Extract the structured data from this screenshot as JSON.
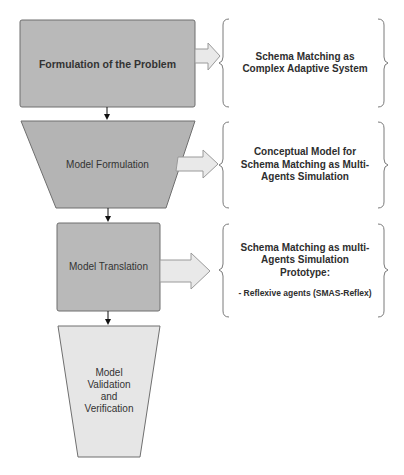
{
  "diagram": {
    "type": "flowchart",
    "direction": "top-to-bottom",
    "colors": {
      "stage_dark": "#b9b9b9",
      "stage_light": "#e6e6e6",
      "stage_border": "#6f6f6f",
      "arrow_fill": "#e9e9e9",
      "arrow_border": "#9a9a9a",
      "brace": "#7a7a7a",
      "text": "#333333"
    },
    "stages": [
      {
        "id": "formulation-of-problem",
        "label": "Formulation of the Problem",
        "shape": "rectangle",
        "description": {
          "title": "Schema Matching as Complex Adaptive System",
          "sub": ""
        }
      },
      {
        "id": "model-formulation",
        "label": "Model Formulation",
        "shape": "trapezoid",
        "description": {
          "title": "Conceptual Model for Schema Matching as Multi-Agents Simulation",
          "sub": ""
        }
      },
      {
        "id": "model-translation",
        "label": "Model Translation",
        "shape": "rectangle",
        "description": {
          "title": "Schema Matching as multi-Agents Simulation Prototype:",
          "sub": "- Reflexive agents (SMAS-Reflex)"
        }
      },
      {
        "id": "model-validation",
        "label": "Model Validation and Verification",
        "shape": "trapezoid",
        "description": null
      }
    ],
    "edges": [
      {
        "from": "formulation-of-problem",
        "to": "model-formulation"
      },
      {
        "from": "model-formulation",
        "to": "model-translation"
      },
      {
        "from": "model-translation",
        "to": "model-validation"
      }
    ]
  }
}
